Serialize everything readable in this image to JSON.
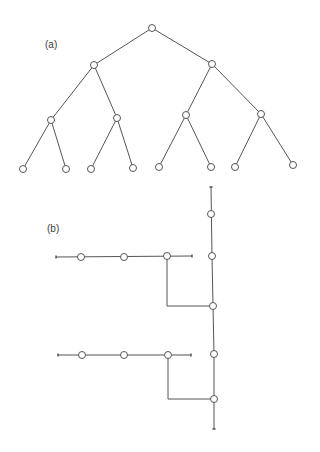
{
  "style": {
    "background": "#ffffff",
    "stroke": "#555555",
    "node_fill": "#ffffff",
    "node_radius": 3.5
  },
  "panel_a": {
    "label": "(a)",
    "label_pos": [
      45,
      40
    ],
    "type": "complete binary tree, depth 3 (15 nodes)",
    "nodes": [
      {
        "id": "r",
        "x": 152,
        "y": 28
      },
      {
        "id": "L",
        "x": 94,
        "y": 65
      },
      {
        "id": "R",
        "x": 212,
        "y": 64
      },
      {
        "id": "LL",
        "x": 51,
        "y": 120
      },
      {
        "id": "LR",
        "x": 117,
        "y": 118
      },
      {
        "id": "RL",
        "x": 186,
        "y": 115
      },
      {
        "id": "RR",
        "x": 261,
        "y": 114
      },
      {
        "id": "LLL",
        "x": 23,
        "y": 169
      },
      {
        "id": "LLR",
        "x": 66,
        "y": 169
      },
      {
        "id": "LRL",
        "x": 91,
        "y": 169
      },
      {
        "id": "LRR",
        "x": 133,
        "y": 168
      },
      {
        "id": "RLL",
        "x": 159,
        "y": 167
      },
      {
        "id": "RLR",
        "x": 211,
        "y": 167
      },
      {
        "id": "RRL",
        "x": 235,
        "y": 167
      },
      {
        "id": "RRR",
        "x": 293,
        "y": 165
      }
    ],
    "edges": [
      [
        "r",
        "L"
      ],
      [
        "r",
        "R"
      ],
      [
        "L",
        "LL"
      ],
      [
        "L",
        "LR"
      ],
      [
        "R",
        "RL"
      ],
      [
        "R",
        "RR"
      ],
      [
        "LL",
        "LLL"
      ],
      [
        "LL",
        "LLR"
      ],
      [
        "LR",
        "LRL"
      ],
      [
        "LR",
        "LRR"
      ],
      [
        "RL",
        "RLL"
      ],
      [
        "RL",
        "RLR"
      ],
      [
        "RR",
        "RRL"
      ],
      [
        "RR",
        "RRR"
      ]
    ]
  },
  "panel_b": {
    "label": "(b)",
    "label_pos": [
      47,
      224
    ],
    "type": "caterpillar / spine layout of the same tree",
    "nodes": [
      {
        "id": "s1",
        "x": 211,
        "y": 214
      },
      {
        "id": "s2",
        "x": 212,
        "y": 256
      },
      {
        "id": "s3",
        "x": 213,
        "y": 306
      },
      {
        "id": "s4",
        "x": 214,
        "y": 354
      },
      {
        "id": "s5",
        "x": 214,
        "y": 399
      },
      {
        "id": "u1",
        "x": 81,
        "y": 257
      },
      {
        "id": "u2",
        "x": 124,
        "y": 257
      },
      {
        "id": "u3",
        "x": 167,
        "y": 256
      },
      {
        "id": "d1",
        "x": 82,
        "y": 355
      },
      {
        "id": "d2",
        "x": 124,
        "y": 355
      },
      {
        "id": "d3",
        "x": 168,
        "y": 355
      }
    ],
    "segments": [
      {
        "name": "spine",
        "points": [
          [
            211,
            187
          ],
          [
            212,
            256
          ],
          [
            213,
            306
          ],
          [
            214,
            354
          ],
          [
            214,
            429
          ]
        ]
      },
      {
        "name": "upper-branch",
        "points": [
          [
            56,
            257
          ],
          [
            192,
            256
          ]
        ]
      },
      {
        "name": "upper-elbow",
        "points": [
          [
            167,
            256
          ],
          [
            167,
            306
          ],
          [
            213,
            306
          ]
        ]
      },
      {
        "name": "lower-branch",
        "points": [
          [
            58,
            355
          ],
          [
            191,
            355
          ]
        ]
      },
      {
        "name": "lower-elbow",
        "points": [
          [
            168,
            355
          ],
          [
            168,
            399
          ],
          [
            214,
            399
          ]
        ]
      }
    ],
    "end_ticks": [
      {
        "x": 211,
        "y": 187,
        "orient": "h"
      },
      {
        "x": 214,
        "y": 429,
        "orient": "h"
      },
      {
        "x": 56,
        "y": 257,
        "orient": "v"
      },
      {
        "x": 192,
        "y": 256,
        "orient": "v"
      },
      {
        "x": 58,
        "y": 355,
        "orient": "v"
      },
      {
        "x": 191,
        "y": 355,
        "orient": "v"
      }
    ]
  }
}
